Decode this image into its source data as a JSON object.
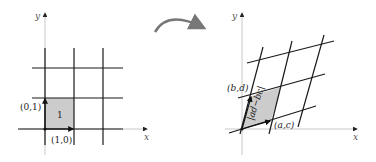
{
  "figure": {
    "left_panel": {
      "x_axis_label": "x",
      "y_axis_label": "y",
      "vector_e1_label": "(1,0)",
      "vector_e2_label": "(0,1)",
      "area_label": "1"
    },
    "transform_arrow": {
      "name": "curved-arrow",
      "color": "#777777"
    },
    "right_panel": {
      "x_axis_label": "x",
      "y_axis_label": "y",
      "vector_a_label": "(a,c)",
      "vector_b_label": "(b,d)",
      "area_label": "|ad−bc|"
    },
    "colors": {
      "grid_lines": "#1a1a1a",
      "axes": "#bbbbbb",
      "shaded_region": "#cccccc",
      "arrow": "#777777"
    }
  }
}
